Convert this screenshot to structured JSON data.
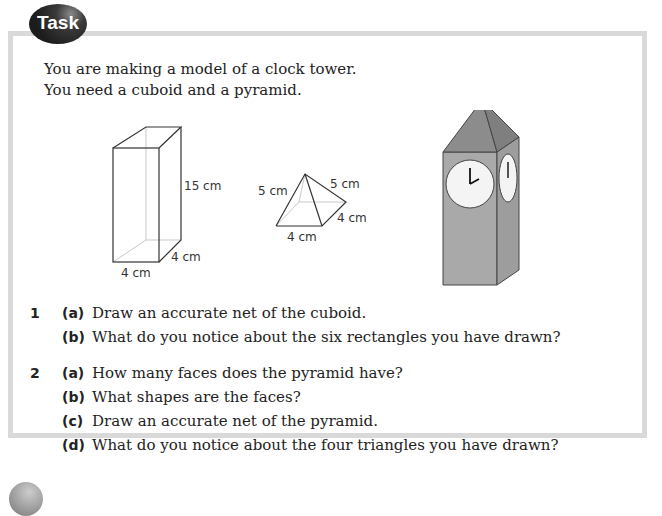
{
  "badge": {
    "label": "Task"
  },
  "intro": {
    "line1": "You are making a model of a clock tower.",
    "line2": "You need a cuboid and a pyramid."
  },
  "figures": {
    "cuboid": {
      "height_label": "15 cm",
      "width_label": "4 cm",
      "depth_label": "4 cm"
    },
    "pyramid": {
      "slant_left_label": "5 cm",
      "slant_right_label": "5 cm",
      "base_label": "4 cm",
      "depth_label": "4 cm"
    },
    "clock_tower": {
      "body_color": "#a9a9a9",
      "roof_color": "#8c8c8c",
      "clock_face_color": "#f4f4f4"
    }
  },
  "questions": [
    {
      "number": "1",
      "parts": [
        {
          "label": "(a)",
          "text": "Draw an accurate net of the cuboid."
        },
        {
          "label": "(b)",
          "text": "What do you notice about the six rectangles you have drawn?"
        }
      ]
    },
    {
      "number": "2",
      "parts": [
        {
          "label": "(a)",
          "text": "How many faces does the pyramid have?"
        },
        {
          "label": "(b)",
          "text": "What shapes are the faces?"
        },
        {
          "label": "(c)",
          "text": "Draw an accurate net of the pyramid."
        },
        {
          "label": "(d)",
          "text": "What do you notice about the four triangles you have drawn?"
        }
      ]
    }
  ]
}
